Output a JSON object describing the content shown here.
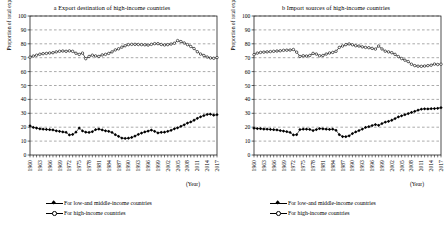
{
  "figure": {
    "width": 448,
    "height": 237,
    "background": "#ffffff",
    "line_color": "#000000"
  },
  "legend": {
    "position": "below-axis",
    "entries": [
      {
        "marker": "filled-diamond-marker",
        "label": "For low-and middle-income countries"
      },
      {
        "marker": "open-circle-marker",
        "label": "For high-income countries"
      }
    ]
  },
  "chart_data": [
    {
      "type": "line",
      "panel": "a",
      "title": "a Export destination of high-income countries",
      "xlabel": "(Year)",
      "ylabel": "Proportion of total exports (%)",
      "ylim": [
        0,
        100
      ],
      "ytick_labels": [
        "0",
        "10",
        "20",
        "30",
        "40",
        "50",
        "60",
        "70",
        "80",
        "90",
        "100"
      ],
      "yticks": [
        0,
        10,
        20,
        30,
        40,
        50,
        60,
        70,
        80,
        90,
        100
      ],
      "grid": "horizontal-dashed",
      "xlim": [
        1960,
        2017
      ],
      "xtick_labels": [
        "1960",
        "1963",
        "1966",
        "1969",
        "1972",
        "1975",
        "1978",
        "1981",
        "1984",
        "1987",
        "1990",
        "1993",
        "1996",
        "1999",
        "2002",
        "2005",
        "2008",
        "2011",
        "2014",
        "2017"
      ],
      "x": [
        1960,
        1961,
        1962,
        1963,
        1964,
        1965,
        1966,
        1967,
        1968,
        1969,
        1970,
        1971,
        1972,
        1973,
        1974,
        1975,
        1976,
        1977,
        1978,
        1979,
        1980,
        1981,
        1982,
        1983,
        1984,
        1985,
        1986,
        1987,
        1988,
        1989,
        1990,
        1991,
        1992,
        1993,
        1994,
        1995,
        1996,
        1997,
        1998,
        1999,
        2000,
        2001,
        2002,
        2003,
        2004,
        2005,
        2006,
        2007,
        2008,
        2009,
        2010,
        2011,
        2012,
        2013,
        2014,
        2015,
        2016,
        2017
      ],
      "series": [
        {
          "name": "For high-income countries",
          "marker": "open-circle-marker",
          "values": [
            70.4,
            71.2,
            71.8,
            72.5,
            72.9,
            73.1,
            73.4,
            73.6,
            74.2,
            74.6,
            74.8,
            74.6,
            74.9,
            74.6,
            73.2,
            72.4,
            73.3,
            69.3,
            70.9,
            71.8,
            71.3,
            70.9,
            72.0,
            72.4,
            73.1,
            74.2,
            75.6,
            76.4,
            77.6,
            78.6,
            79.4,
            79.6,
            79.6,
            79.5,
            79.4,
            79.3,
            79.1,
            79.6,
            80.1,
            80.1,
            79.5,
            79.2,
            79.4,
            79.8,
            80.4,
            82.3,
            81.6,
            80.6,
            79.4,
            78.1,
            76.6,
            74.3,
            72.6,
            71.6,
            70.5,
            69.8,
            69.6,
            70.1
          ]
        },
        {
          "name": "For low-and middle-income countries",
          "marker": "filled-diamond-marker",
          "values": [
            21.0,
            19.8,
            19.4,
            18.8,
            18.6,
            18.4,
            18.2,
            18.0,
            17.4,
            17.0,
            16.6,
            16.3,
            14.4,
            14.8,
            16.4,
            19.4,
            17.3,
            16.4,
            16.2,
            16.8,
            18.2,
            18.7,
            18.0,
            17.4,
            17.0,
            16.2,
            14.6,
            13.4,
            12.2,
            11.9,
            12.1,
            12.6,
            13.6,
            14.8,
            15.8,
            16.6,
            17.2,
            17.9,
            17.0,
            15.9,
            16.3,
            16.4,
            17.0,
            17.8,
            18.8,
            19.6,
            20.6,
            21.7,
            23.0,
            23.8,
            25.0,
            26.4,
            27.5,
            28.4,
            29.2,
            29.4,
            28.6,
            29.0
          ]
        }
      ]
    },
    {
      "type": "line",
      "panel": "b",
      "title": "b Import sources of high-income countries",
      "xlabel": "(Year)",
      "ylabel": "Proportion of total exports (%)",
      "ylim": [
        0,
        100
      ],
      "ytick_labels": [
        "0",
        "10",
        "20",
        "30",
        "40",
        "50",
        "60",
        "70",
        "80",
        "90",
        "100"
      ],
      "yticks": [
        0,
        10,
        20,
        30,
        40,
        50,
        60,
        70,
        80,
        90,
        100
      ],
      "grid": "horizontal-dashed",
      "xlim": [
        1960,
        2017
      ],
      "xtick_labels": [
        "1960",
        "1963",
        "1966",
        "1969",
        "1972",
        "1975",
        "1978",
        "1981",
        "1984",
        "1987",
        "1990",
        "1993",
        "1996",
        "1999",
        "2002",
        "2005",
        "2008",
        "2011",
        "2014",
        "2017"
      ],
      "x": [
        1960,
        1961,
        1962,
        1963,
        1964,
        1965,
        1966,
        1967,
        1968,
        1969,
        1970,
        1971,
        1972,
        1973,
        1974,
        1975,
        1976,
        1977,
        1978,
        1979,
        1980,
        1981,
        1982,
        1983,
        1984,
        1985,
        1986,
        1987,
        1988,
        1989,
        1990,
        1991,
        1992,
        1993,
        1994,
        1995,
        1996,
        1997,
        1998,
        1999,
        2000,
        2001,
        2002,
        2003,
        2004,
        2005,
        2006,
        2007,
        2008,
        2009,
        2010,
        2011,
        2012,
        2013,
        2014,
        2015,
        2016,
        2017
      ],
      "series": [
        {
          "name": "For high-income countries",
          "marker": "open-circle-marker",
          "values": [
            72.2,
            73.3,
            73.8,
            74.0,
            74.2,
            74.4,
            74.6,
            74.8,
            75.0,
            75.3,
            75.4,
            75.5,
            75.9,
            74.0,
            70.9,
            71.4,
            71.2,
            71.6,
            73.1,
            72.6,
            71.4,
            71.6,
            72.6,
            73.4,
            73.8,
            74.6,
            77.4,
            78.4,
            79.4,
            79.9,
            79.3,
            78.6,
            78.4,
            77.8,
            77.4,
            77.2,
            76.7,
            76.2,
            78.4,
            76.3,
            74.7,
            74.2,
            73.6,
            72.4,
            70.8,
            69.4,
            68.2,
            67.2,
            65.3,
            64.3,
            63.9,
            63.8,
            64.0,
            64.3,
            64.6,
            65.4,
            65.1,
            65.3
          ]
        },
        {
          "name": "For low-and middle-income countries",
          "marker": "filled-diamond-marker",
          "values": [
            19.3,
            19.0,
            18.9,
            18.7,
            18.6,
            18.4,
            18.2,
            18.0,
            17.6,
            17.2,
            16.8,
            16.2,
            14.4,
            14.6,
            18.3,
            18.6,
            18.6,
            18.4,
            17.6,
            18.3,
            19.0,
            18.8,
            18.6,
            18.4,
            18.6,
            17.8,
            14.6,
            13.3,
            13.2,
            13.8,
            15.4,
            16.6,
            17.6,
            18.6,
            19.8,
            20.4,
            21.2,
            21.9,
            21.4,
            22.6,
            23.6,
            24.2,
            25.0,
            26.2,
            27.4,
            28.2,
            29.0,
            29.8,
            30.6,
            31.4,
            32.2,
            33.0,
            33.2,
            33.1,
            33.3,
            33.4,
            33.6,
            34.0
          ]
        }
      ]
    }
  ]
}
